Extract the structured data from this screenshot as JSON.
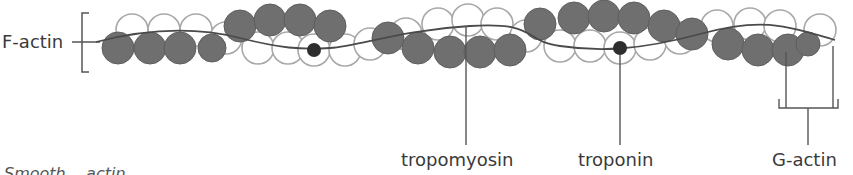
{
  "diagram": {
    "labels": {
      "f_actin": "F-actin",
      "tropomyosin": "tropomyosin",
      "troponin": "troponin",
      "g_actin": "G-actin"
    },
    "caption_partial": "Smooth... actin",
    "colors": {
      "filled_bead": "#6f6f6f",
      "open_bead_stroke": "#a8a8a8",
      "troponin_dot": "#2e2e2e",
      "strand": "#4a4a4a",
      "text": "#3a3a3a"
    }
  }
}
